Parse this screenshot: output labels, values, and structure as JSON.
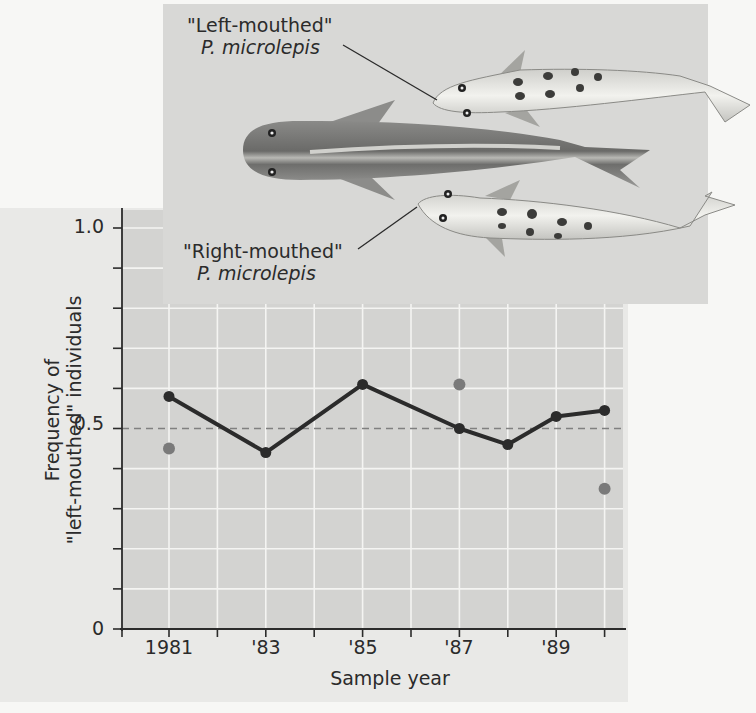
{
  "figure": {
    "labels": {
      "left_mouthed": {
        "name": "\"Left-mouthed\"",
        "species": "P. microlepis"
      },
      "right_mouthed": {
        "name": "\"Right-mouthed\"",
        "species": "P. microlepis"
      }
    },
    "colors": {
      "main_series": "#2b2b2b",
      "secondary_points": "#7a7a7a",
      "reference_line": "#808080",
      "plot_background": "#d3d3d1",
      "panel_background": "#e9e9e7",
      "inset_background": "#d8d8d6",
      "gridlines": "#f4f4f2"
    }
  },
  "axes": {
    "ylabel_line1": "Frequency of",
    "ylabel_line2": "\"left-mouthed\" individuals",
    "xlabel": "Sample year",
    "yticks": [
      {
        "label": "1.0",
        "value": 1.0
      },
      {
        "label": "0.5",
        "value": 0.5
      },
      {
        "label": "0",
        "value": 0
      }
    ],
    "xticks": [
      {
        "label": "1981",
        "year": 1981
      },
      {
        "label": "'83",
        "year": 1983
      },
      {
        "label": "'85",
        "year": 1985
      },
      {
        "label": "'87",
        "year": 1987
      },
      {
        "label": "'89",
        "year": 1989
      }
    ]
  },
  "chart_data": {
    "type": "line",
    "title": "",
    "xlabel": "Sample year",
    "ylabel": "Frequency of \"left-mouthed\" individuals",
    "xlim": [
      1980,
      1990
    ],
    "ylim": [
      0,
      1.0
    ],
    "grid": true,
    "y_tick_step": 0.1,
    "x_tick_step": 1,
    "x_tick_labels": [
      "1981",
      "'83",
      "'85",
      "'87",
      "'89"
    ],
    "y_tick_labels": [
      "0",
      "0.5",
      "1.0"
    ],
    "reference_line": {
      "y": 0.5,
      "style": "dashed"
    },
    "series": [
      {
        "name": "Frequency of left-mouthed individuals",
        "style": "solid line with black markers",
        "x": [
          1981,
          1983,
          1985,
          1987,
          1988,
          1989,
          1990
        ],
        "values": [
          0.58,
          0.44,
          0.61,
          0.5,
          0.46,
          0.53,
          0.545
        ]
      },
      {
        "name": "Unconnected gray points",
        "style": "gray markers, no line",
        "x": [
          1981,
          1987,
          1990
        ],
        "values": [
          0.45,
          0.61,
          0.35
        ]
      }
    ],
    "annotations": [
      "\"Left-mouthed\" P. microlepis",
      "\"Right-mouthed\" P. microlepis"
    ]
  }
}
